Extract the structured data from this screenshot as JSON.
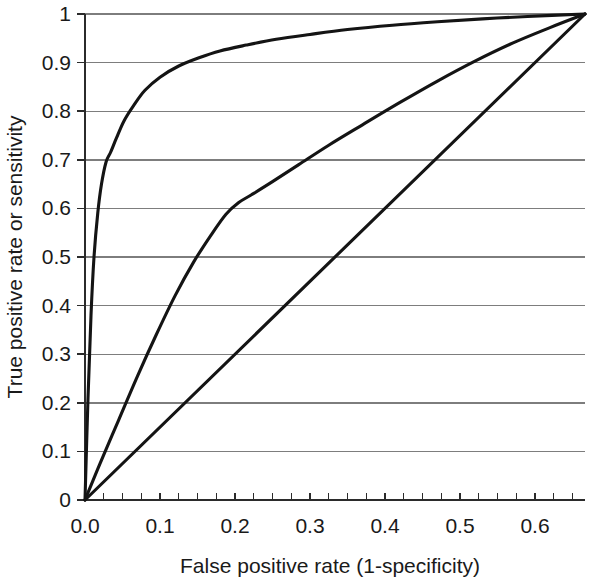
{
  "chart_data": {
    "type": "line",
    "title": "",
    "xlabel": "False positive rate (1-specificity)",
    "ylabel": "True positive rate or sensitivity",
    "xlim": [
      0,
      0.6667
    ],
    "ylim": [
      0,
      1
    ],
    "grid": "horizontal",
    "legend": "none",
    "xticks": [
      0,
      0.1,
      0.2,
      0.3,
      0.4,
      0.5,
      0.6
    ],
    "xtick_labels": [
      "0.0",
      "0.1",
      "0.2",
      "0.3",
      "0.4",
      "0.5",
      "0.6"
    ],
    "x_minor_tick_step": 0.025,
    "yticks": [
      0,
      0.1,
      0.2,
      0.3,
      0.4,
      0.5,
      0.6,
      0.7,
      0.8,
      0.9,
      1
    ],
    "ytick_labels": [
      "0",
      "0.1",
      "0.2",
      "0.3",
      "0.4",
      "0.5",
      "0.6",
      "0.7",
      "0.8",
      "0.9",
      "1"
    ],
    "series": [
      {
        "name": "excellent-test-curve",
        "points": [
          [
            0.0,
            0.0
          ],
          [
            0.004,
            0.21
          ],
          [
            0.008,
            0.38
          ],
          [
            0.012,
            0.5
          ],
          [
            0.017,
            0.59
          ],
          [
            0.022,
            0.65
          ],
          [
            0.028,
            0.695
          ],
          [
            0.034,
            0.715
          ],
          [
            0.042,
            0.745
          ],
          [
            0.052,
            0.78
          ],
          [
            0.065,
            0.812
          ],
          [
            0.08,
            0.843
          ],
          [
            0.1,
            0.87
          ],
          [
            0.125,
            0.893
          ],
          [
            0.152,
            0.91
          ],
          [
            0.18,
            0.924
          ],
          [
            0.215,
            0.936
          ],
          [
            0.255,
            0.948
          ],
          [
            0.3,
            0.958
          ],
          [
            0.35,
            0.968
          ],
          [
            0.41,
            0.977
          ],
          [
            0.47,
            0.984
          ],
          [
            0.53,
            0.99
          ],
          [
            0.59,
            0.995
          ],
          [
            0.6667,
            1.0
          ]
        ]
      },
      {
        "name": "moderate-test-curve",
        "points": [
          [
            0.0,
            0.0
          ],
          [
            0.02,
            0.075
          ],
          [
            0.045,
            0.165
          ],
          [
            0.07,
            0.255
          ],
          [
            0.095,
            0.34
          ],
          [
            0.12,
            0.42
          ],
          [
            0.145,
            0.49
          ],
          [
            0.168,
            0.545
          ],
          [
            0.188,
            0.588
          ],
          [
            0.205,
            0.612
          ],
          [
            0.222,
            0.628
          ],
          [
            0.25,
            0.655
          ],
          [
            0.285,
            0.69
          ],
          [
            0.325,
            0.73
          ],
          [
            0.37,
            0.772
          ],
          [
            0.42,
            0.818
          ],
          [
            0.47,
            0.862
          ],
          [
            0.52,
            0.903
          ],
          [
            0.57,
            0.94
          ],
          [
            0.62,
            0.972
          ],
          [
            0.6667,
            1.0
          ]
        ]
      },
      {
        "name": "chance-line",
        "points": [
          [
            0.0,
            0.0
          ],
          [
            0.6667,
            1.0
          ]
        ]
      }
    ]
  }
}
